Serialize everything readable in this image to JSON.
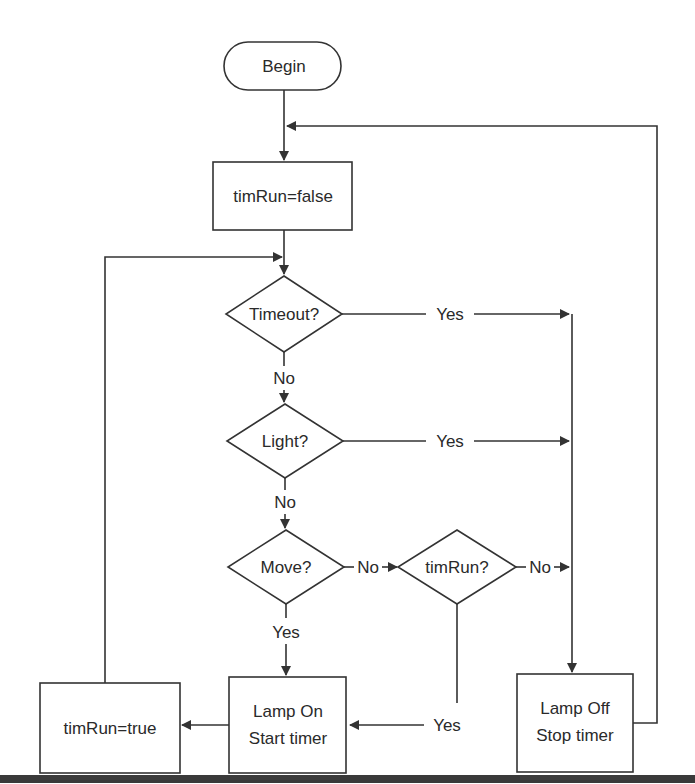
{
  "flowchart": {
    "start": {
      "label": "Begin"
    },
    "init": {
      "label": "timRun=false"
    },
    "decisions": {
      "timeout": {
        "label": "Timeout?",
        "yes": "Yes",
        "no": "No"
      },
      "light": {
        "label": "Light?",
        "yes": "Yes",
        "no": "No"
      },
      "move": {
        "label": "Move?",
        "yes": "Yes",
        "no": "No"
      },
      "timrun": {
        "label": "timRun?",
        "yes": "Yes",
        "no": "No"
      }
    },
    "lamp_on": {
      "line1": "Lamp On",
      "line2": "Start timer"
    },
    "set_true": {
      "label": "timRun=true"
    },
    "lamp_off": {
      "line1": "Lamp Off",
      "line2": "Stop timer"
    }
  },
  "colors": {
    "stroke": "#333333",
    "text": "#2a2a2a",
    "background": "#ffffff",
    "bar": "#3a3a3a"
  }
}
